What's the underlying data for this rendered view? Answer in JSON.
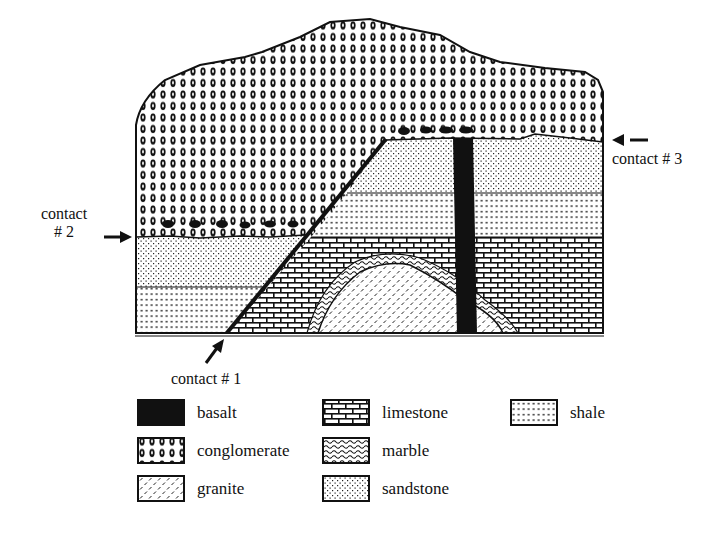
{
  "diagram": {
    "contacts": [
      {
        "id": "contact-1",
        "label": "contact # 1"
      },
      {
        "id": "contact-2",
        "label_line1": "contact",
        "label_line2": "# 2"
      },
      {
        "id": "contact-3",
        "label": "contact # 3"
      }
    ]
  },
  "legend": {
    "items": [
      {
        "key": "basalt",
        "label": "basalt"
      },
      {
        "key": "conglomerate",
        "label": "conglomerate"
      },
      {
        "key": "granite",
        "label": "granite"
      },
      {
        "key": "limestone",
        "label": "limestone"
      },
      {
        "key": "marble",
        "label": "marble"
      },
      {
        "key": "sandstone",
        "label": "sandstone"
      },
      {
        "key": "shale",
        "label": "shale"
      }
    ]
  },
  "colors": {
    "ink": "#111111",
    "paper": "#ffffff"
  }
}
